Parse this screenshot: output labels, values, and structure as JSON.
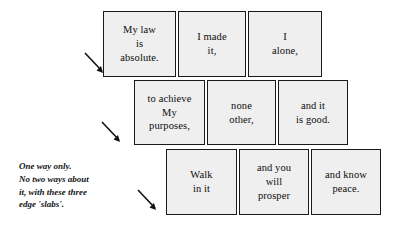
{
  "diagram": {
    "type": "slab-flow-diagram",
    "background_color": "#ffffff",
    "slab_fill_color": "#efefef",
    "slab_border_color": "#1a1a1a",
    "text_color": "#0d0d0d",
    "rows": [
      {
        "row_index": 1,
        "slabs": [
          {
            "text": "My law\nis\nabsolute."
          },
          {
            "text": "I made\nit,"
          },
          {
            "text": "I\nalone,"
          }
        ]
      },
      {
        "row_index": 2,
        "slabs": [
          {
            "text": "to achieve\nMy\npurposes,"
          },
          {
            "text": "none\nother,"
          },
          {
            "text": "and it\nis good."
          }
        ]
      },
      {
        "row_index": 3,
        "slabs": [
          {
            "text": "Walk\nin it"
          },
          {
            "text": "and you\nwill\nprosper"
          },
          {
            "text": "and know\npeace."
          }
        ]
      }
    ],
    "arrows": [
      {
        "name": "arrow-row-1",
        "direction": "down-right"
      },
      {
        "name": "arrow-row-2",
        "direction": "down-right"
      },
      {
        "name": "arrow-row-3",
        "direction": "down-right"
      }
    ],
    "caption": "One way only.\nNo two ways about\nit, with these three\nedge 'slabs'."
  }
}
